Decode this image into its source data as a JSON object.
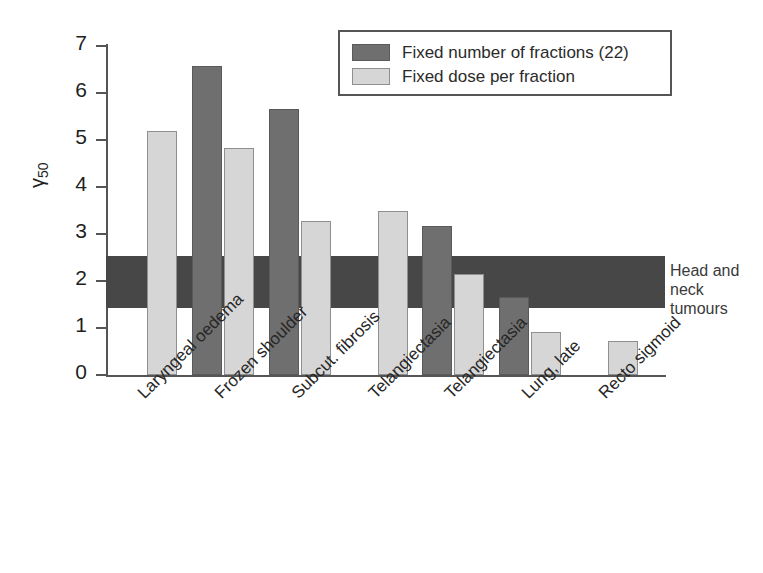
{
  "chart_data": {
    "type": "bar",
    "title": "",
    "subtitle": "",
    "xlabel": "",
    "ylabel": "γ50",
    "ylim": [
      0,
      7
    ],
    "ytick_labels": [
      "0",
      "1",
      "2",
      "3",
      "4",
      "5",
      "6",
      "7"
    ],
    "ytick_values": [
      0,
      1,
      2,
      3,
      4,
      5,
      6,
      7
    ],
    "grid": false,
    "legend_position": "top-right",
    "categories": [
      "Laryngeal oedema",
      "Frozen shoulder",
      "Subcut. fibrosis",
      "Telangiectasia",
      "Telangiectasia",
      "Lung, late",
      "Recto sigmoid"
    ],
    "series": [
      {
        "name": "Fixed number of fractions (22)",
        "color": "#6f6f6f",
        "values": [
          null,
          6.57,
          5.65,
          null,
          3.18,
          1.67,
          null
        ]
      },
      {
        "name": "Fixed dose per fraction",
        "color": "#d6d6d6",
        "values": [
          5.2,
          4.82,
          3.28,
          3.49,
          2.15,
          0.92,
          0.72
        ]
      }
    ],
    "annotations": [
      {
        "type": "hband",
        "label": "Head and neck tumours",
        "ymin": 1.43,
        "ymax": 2.53,
        "color": "#474747"
      }
    ]
  },
  "legend": {
    "items": [
      {
        "label": "Fixed number of fractions (22)",
        "swatch": "dark"
      },
      {
        "label": "Fixed dose per fraction",
        "swatch": "light"
      }
    ]
  },
  "axis": {
    "y_title_main": "γ",
    "y_title_sub": "50"
  },
  "band": {
    "label_line1": "Head and neck",
    "label_line2": "tumours"
  }
}
